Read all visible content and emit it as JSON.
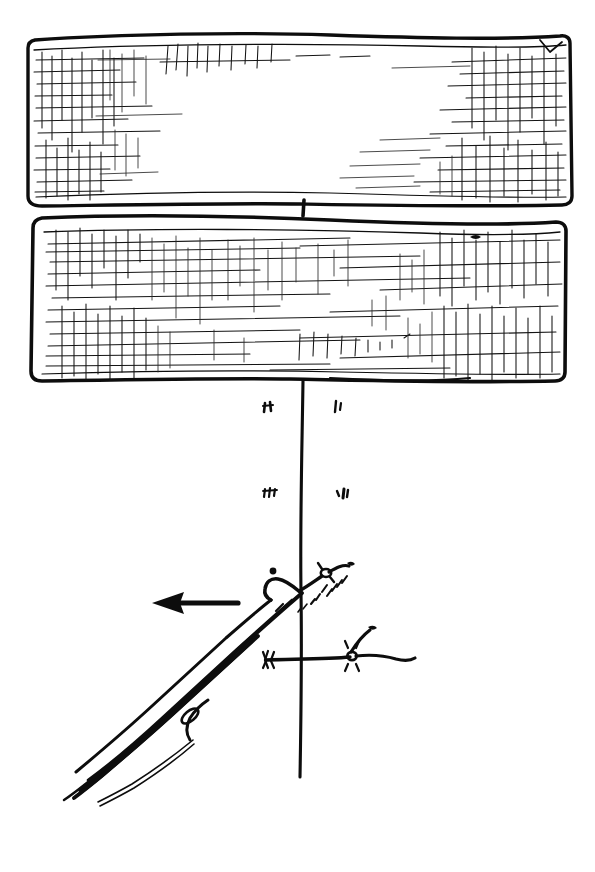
{
  "figure": {
    "title": "Hand-drawn sketch: fencing pliers pulling barbed wire past two hatched boards",
    "medium": "black ink line drawing on white paper",
    "background_color": "#ffffff",
    "ink_color": "#0d0d0d",
    "canvas": {
      "width": 595,
      "height": 872
    }
  },
  "elements": {
    "board_top": {
      "label": "upper hatched board",
      "shape": "horizontal rectangular plank with rough freehand outline",
      "bounds": {
        "x": 27,
        "y": 38,
        "width": 546,
        "height": 168
      },
      "shading": "dense cross-hatching at left and right ends, blank center",
      "interactable": false
    },
    "board_bottom": {
      "label": "lower hatched board",
      "shape": "horizontal rectangular plank with rough freehand outline",
      "bounds": {
        "x": 31,
        "y": 216,
        "width": 534,
        "height": 166
      },
      "shading": "cross-hatching across most of the plank, heaviest at left and right ends",
      "interactable": false
    },
    "post_line": {
      "label": "vertical post line",
      "shape": "single long vertical stroke",
      "from": {
        "x": 303,
        "y": 199
      },
      "to": {
        "x": 301,
        "y": 777
      },
      "interactable": false
    },
    "tick_marks": {
      "label": "small ink tick marks beside the post",
      "count": 4,
      "marks": [
        {
          "name": "tick-upper-left",
          "x": 268,
          "y": 407
        },
        {
          "name": "tick-upper-right",
          "x": 338,
          "y": 406
        },
        {
          "name": "tick-lower-left",
          "x": 270,
          "y": 492
        },
        {
          "name": "tick-lower-right",
          "x": 342,
          "y": 494
        }
      ],
      "interactable": false
    },
    "pliers": {
      "label": "fencing pliers / wire pulling tool",
      "orientation": "diagonal, handles to lower left, jaws at upper right",
      "jaw_point": {
        "x": 300,
        "y": 592
      },
      "handle_end": {
        "x": 72,
        "y": 790
      },
      "details": "two long handles, pivot eyelet, open jaw gripping the wire",
      "interactable": false
    },
    "direction_arrow": {
      "label": "pull direction arrow",
      "points": "left",
      "tail": {
        "x": 238,
        "y": 603
      },
      "head": {
        "x": 152,
        "y": 603
      },
      "interactable": false
    },
    "wire_upper": {
      "label": "barbed wire strand held in the jaws",
      "path": "rises to the upper right from the jaw, barb knot with short spurs, dashed frayed strands below",
      "interactable": false
    },
    "wire_lower": {
      "label": "horizontal barbed wire strand crossing the post",
      "path": "runs left to right across the post with two barb knots and spurs",
      "interactable": false
    },
    "ink_dot": {
      "label": "small isolated ink dot",
      "x": 273,
      "y": 571,
      "interactable": false
    }
  }
}
